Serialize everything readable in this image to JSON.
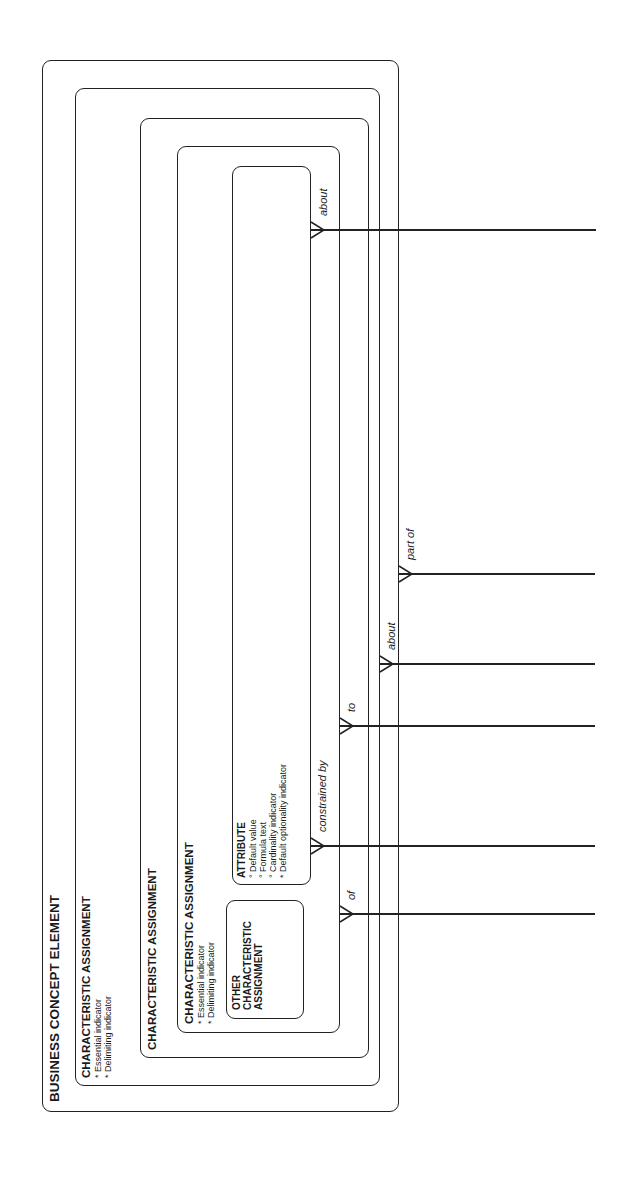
{
  "diagram": {
    "type": "entity-relationship (nested subtypes, rotated 90°)",
    "entities": {
      "outer": {
        "title": "BUSINESS CONCEPT ELEMENT"
      },
      "char_assign_1": {
        "title": "CHARACTERISTIC ASSIGNMENT",
        "attributes": [
          "* Essential indicator",
          "* Delimiting indicator"
        ]
      },
      "char_assign_2": {
        "title": "CHARACTERISTIC ASSIGNMENT"
      },
      "char_assign_3": {
        "title": "CHARACTERISTIC ASSIGNMENT",
        "attributes": [
          "* Essential indicator",
          "* Delimiting indicator"
        ]
      },
      "other_char_assign": {
        "title_lines": [
          "OTHER",
          "CHARACTERISTIC",
          "ASSIGNMENT"
        ]
      },
      "attribute": {
        "title": "ATTRIBUTE",
        "attributes": [
          "° Default value",
          "° Formula text",
          "° Cardinality indicator",
          "* Default optionality indicator"
        ]
      }
    },
    "relationships": [
      {
        "label": "about",
        "from": "inner-top-box"
      },
      {
        "label": "part of",
        "from": "outer"
      },
      {
        "label": "about",
        "from": "char_assign_1"
      },
      {
        "label": "to",
        "from": "char_assign_3"
      },
      {
        "label": "constrained by",
        "from": "attribute"
      },
      {
        "label": "of",
        "from": "char_assign_3"
      }
    ]
  }
}
